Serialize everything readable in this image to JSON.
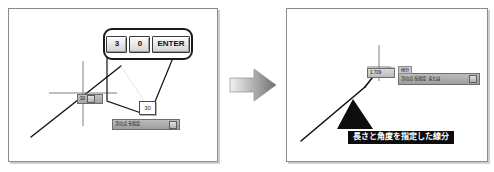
{
  "figure": {
    "arrow_icon": "right-arrow-icon"
  },
  "left_panel": {
    "keystroke_callout": {
      "keys": [
        {
          "label": "3",
          "name": "key-3"
        },
        {
          "label": "0",
          "name": "key-0"
        },
        {
          "label": "ENTER",
          "name": "key-enter"
        }
      ]
    },
    "dynamic_input": {
      "value": "30"
    },
    "command_bar": {
      "text": "次の点を指定",
      "button_icon": "dropdown-button-icon"
    },
    "angle_tag": {
      "text": "30"
    }
  },
  "right_panel": {
    "length_tag": {
      "text": "1.709"
    },
    "command_bar": {
      "caption": "線分",
      "text": "次の点を指定 または",
      "button_icon": "dropdown-button-icon"
    },
    "annotation": {
      "text": "長さと角度を指定した線分"
    }
  },
  "colors": {
    "panel_border": "#8a8a8a",
    "balloon_border": "#1a1a1a",
    "command_bar_bg": "#a8a8a8",
    "annotation_bg": "#0d0d0d",
    "annotation_fg": "#ffffff",
    "arrow_fill": "#9a9a9a"
  }
}
